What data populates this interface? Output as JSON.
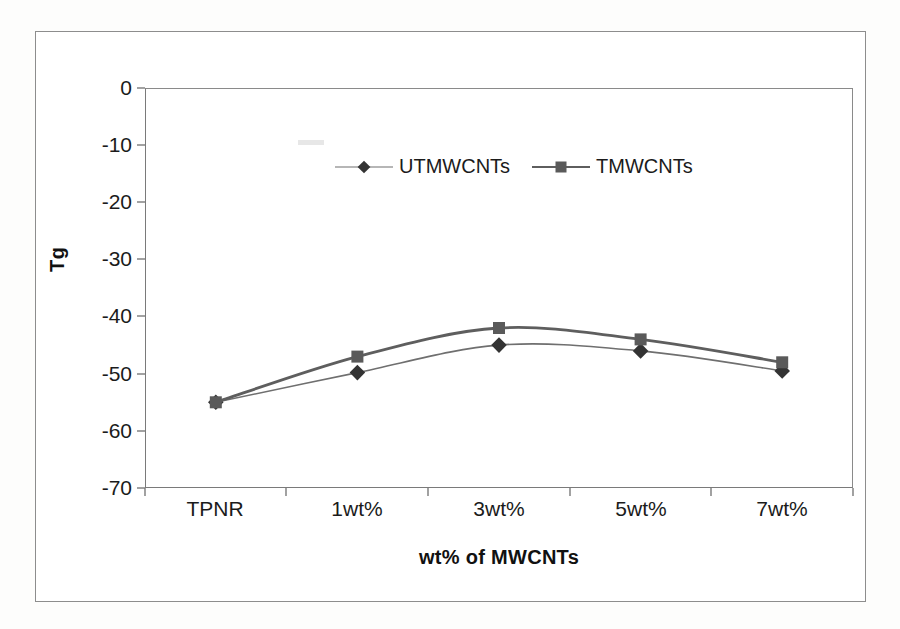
{
  "chart_data": {
    "type": "line",
    "title": "",
    "xlabel": "wt% of MWCNTs",
    "ylabel": "Tg",
    "categories": [
      "TPNR",
      "1wt%",
      "3wt%",
      "5wt%",
      "7wt%"
    ],
    "ylim": [
      -70,
      0
    ],
    "yticks": [
      0,
      -10,
      -20,
      -30,
      -40,
      -50,
      -60,
      -70
    ],
    "ytick_labels": [
      "0",
      "-10",
      "-20",
      "-30",
      "-40",
      "-50",
      "-60",
      "-70"
    ],
    "grid": false,
    "legend_position": "top-center-inside",
    "series": [
      {
        "name": "UTMWCNTs",
        "marker": "diamond",
        "color": "#333333",
        "line_width": "thin",
        "values": [
          -55.0,
          -49.8,
          -45.0,
          -46.0,
          -49.5
        ]
      },
      {
        "name": "TMWCNTs",
        "marker": "square",
        "color": "#5a5a5a",
        "line_width": "thick",
        "values": [
          -55.0,
          -47.0,
          -42.0,
          -44.0,
          -48.0
        ]
      }
    ]
  },
  "axis": {
    "y_title": "Tg",
    "x_title": "wt% of MWCNTs"
  },
  "legend": {
    "entries": [
      {
        "label": "UTMWCNTs",
        "marker": "diamond-marker-icon"
      },
      {
        "label": "TMWCNTs",
        "marker": "square-marker-icon"
      }
    ]
  },
  "colors": {
    "series_utmwcnts": "#333333",
    "series_tmwcnts": "#5a5a5a",
    "axis": "#7a7a7a",
    "text": "#1b1b1b",
    "background": "#ffffff"
  }
}
